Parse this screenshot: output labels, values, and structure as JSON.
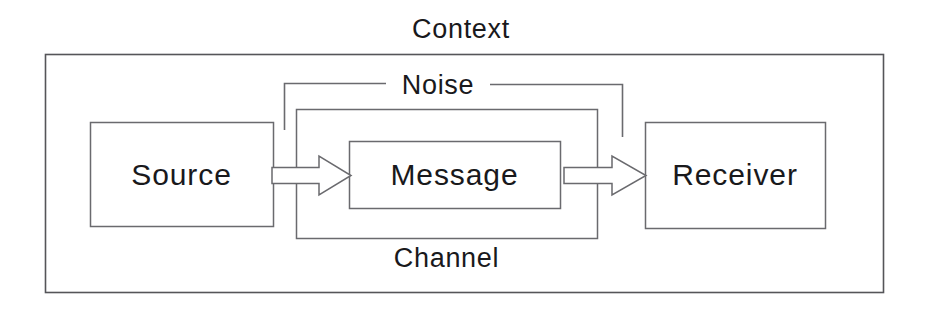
{
  "diagram": {
    "type": "block-diagram",
    "background_color": "#ffffff",
    "stroke_color": "#4a4a4f",
    "text_color": "#19191c",
    "labels": {
      "context": "Context",
      "noise": "Noise",
      "channel": "Channel",
      "source": "Source",
      "message": "Message",
      "receiver": "Receiver"
    },
    "boxes": [
      {
        "name": "context",
        "label": "Context",
        "x": 45,
        "y": 54,
        "width": 838,
        "height": 238
      },
      {
        "name": "source",
        "label": "Source",
        "x": 90,
        "y": 122,
        "width": 183,
        "height": 104
      },
      {
        "name": "channel",
        "label": "Channel",
        "x": 296,
        "y": 109,
        "width": 301,
        "height": 129
      },
      {
        "name": "message",
        "label": "Message",
        "x": 349,
        "y": 141,
        "width": 211,
        "height": 67
      },
      {
        "name": "receiver",
        "label": "Receiver",
        "x": 645,
        "y": 122,
        "width": 180,
        "height": 106
      }
    ],
    "arrows": [
      {
        "name": "source-to-message",
        "from": "source",
        "to": "message",
        "x1": 273,
        "x2": 350,
        "y": 175,
        "direction": "right"
      },
      {
        "name": "message-to-receiver",
        "from": "message",
        "to": "receiver",
        "x1": 565,
        "x2": 645,
        "y": 175,
        "direction": "right"
      }
    ],
    "noise_bracket": {
      "label": "Noise",
      "left_x": 284,
      "right_x": 622,
      "top_y": 83,
      "left_bottom_y": 130,
      "right_bottom_y": 137
    }
  }
}
